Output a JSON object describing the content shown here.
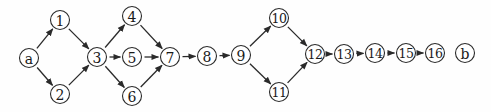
{
  "diagram": {
    "type": "directed-graph",
    "colors": {
      "stroke": "#2a2a2a",
      "text": "#1a1a1a",
      "background": "#fefefe"
    },
    "node_radius": 9.5,
    "nodes": [
      {
        "id": "a",
        "label": "a",
        "x": 29,
        "y": 58
      },
      {
        "id": "1",
        "label": "1",
        "x": 60,
        "y": 20
      },
      {
        "id": "2",
        "label": "2",
        "x": 60,
        "y": 94
      },
      {
        "id": "3",
        "label": "3",
        "x": 97,
        "y": 57
      },
      {
        "id": "4",
        "label": "4",
        "x": 132,
        "y": 16
      },
      {
        "id": "5",
        "label": "5",
        "x": 132,
        "y": 57
      },
      {
        "id": "6",
        "label": "6",
        "x": 132,
        "y": 96
      },
      {
        "id": "7",
        "label": "7",
        "x": 170,
        "y": 57
      },
      {
        "id": "8",
        "label": "8",
        "x": 207,
        "y": 56
      },
      {
        "id": "9",
        "label": "9",
        "x": 241,
        "y": 55
      },
      {
        "id": "10",
        "label": "10",
        "x": 279,
        "y": 18
      },
      {
        "id": "11",
        "label": "11",
        "x": 279,
        "y": 92
      },
      {
        "id": "12",
        "label": "12",
        "x": 315,
        "y": 54
      },
      {
        "id": "13",
        "label": "13",
        "x": 344,
        "y": 54
      },
      {
        "id": "14",
        "label": "14",
        "x": 375,
        "y": 53
      },
      {
        "id": "15",
        "label": "15",
        "x": 406,
        "y": 53
      },
      {
        "id": "16",
        "label": "16",
        "x": 435,
        "y": 53
      },
      {
        "id": "b",
        "label": "b",
        "x": 465,
        "y": 53
      }
    ],
    "edges": [
      {
        "from": "a",
        "to": "1"
      },
      {
        "from": "a",
        "to": "2"
      },
      {
        "from": "1",
        "to": "3"
      },
      {
        "from": "2",
        "to": "3"
      },
      {
        "from": "3",
        "to": "4"
      },
      {
        "from": "3",
        "to": "5"
      },
      {
        "from": "3",
        "to": "6"
      },
      {
        "from": "4",
        "to": "7"
      },
      {
        "from": "5",
        "to": "7"
      },
      {
        "from": "6",
        "to": "7"
      },
      {
        "from": "7",
        "to": "8"
      },
      {
        "from": "8",
        "to": "9"
      },
      {
        "from": "9",
        "to": "10"
      },
      {
        "from": "9",
        "to": "11"
      },
      {
        "from": "10",
        "to": "12"
      },
      {
        "from": "11",
        "to": "12"
      },
      {
        "from": "12",
        "to": "13"
      },
      {
        "from": "13",
        "to": "14"
      },
      {
        "from": "14",
        "to": "15"
      },
      {
        "from": "15",
        "to": "16"
      }
    ]
  }
}
